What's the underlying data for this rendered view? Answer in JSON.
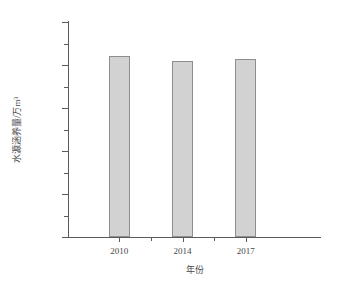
{
  "chart_data": {
    "type": "bar",
    "title": "",
    "subtitle": "",
    "xlabel": "年份",
    "ylabel": "水源涵养量/万m³",
    "categories": [
      "2010",
      "2014",
      "2017"
    ],
    "values": [
      4220,
      4100,
      4130
    ],
    "series": [
      {
        "name": "水源涵养量",
        "values": [
          4220,
          4100,
          4130
        ]
      }
    ],
    "ylim": [
      0,
      5000
    ],
    "ytick_labels": [
      "0",
      "1000",
      "2000",
      "3000",
      "4000",
      "5000"
    ],
    "ytick_values": [
      0,
      1000,
      2000,
      3000,
      4000,
      5000
    ],
    "yminor_tick_values": [
      500,
      1500,
      2500,
      3500,
      4500
    ],
    "xtick_labels": [
      "2010",
      "2014",
      "2017"
    ],
    "grid": false,
    "legend": null,
    "legend_position": "none",
    "annotations": [],
    "colors": {
      "bar_fill": "#d2d2d2",
      "bar_border": "#8e8e8e",
      "axis": "#5a5a5a",
      "text": "#474747",
      "background": "#ffffff"
    }
  }
}
